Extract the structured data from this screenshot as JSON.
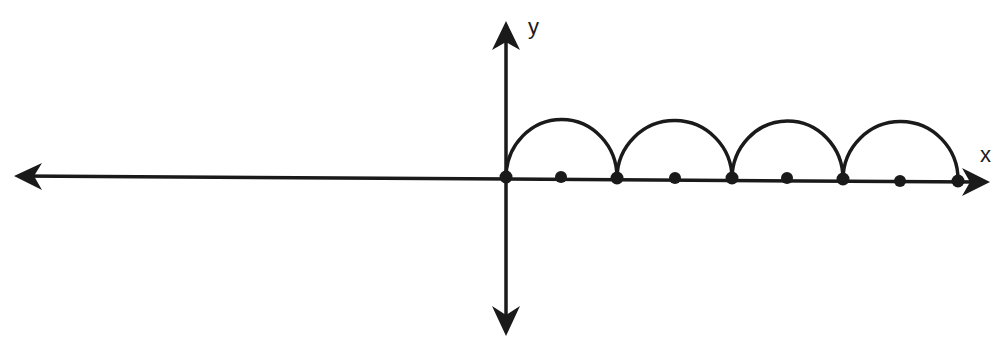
{
  "diagram": {
    "type": "coordinate-plane-with-semicircle-arcs",
    "colors": {
      "stroke": "#1a1a1a",
      "background": "#ffffff"
    },
    "axes": {
      "x_label": "x",
      "y_label": "y"
    },
    "arc_count": 4,
    "endpoints_count": 5,
    "midpoints_count": 4
  }
}
